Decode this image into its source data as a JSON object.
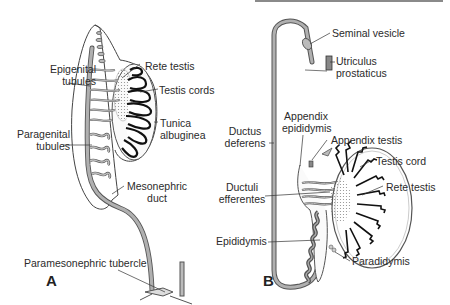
{
  "figure": {
    "panels": [
      {
        "id": "A",
        "label": "A",
        "labels": {
          "epigenital_tubules": [
            "Epigenital",
            "tubules"
          ],
          "paragenital_tubules": [
            "Paragenital",
            "tubules"
          ],
          "rete_testis": "Rete testis",
          "testis_cords": "Testis cords",
          "tunica_albuginea": [
            "Tunica",
            "albuginea"
          ],
          "mesonephric_duct": [
            "Mesonephric",
            "duct"
          ],
          "paramesonephric_tubercle": "Paramesonephric tubercle"
        }
      },
      {
        "id": "B",
        "label": "B",
        "labels": {
          "seminal_vesicle": "Seminal vesicle",
          "utriculus_prostaticus": [
            "Utriculus",
            "prostaticus"
          ],
          "appendix_epididymis": [
            "Appendix",
            "epididymis"
          ],
          "appendix_testis": "Appendix testis",
          "ductus_deferens": [
            "Ductus",
            "deferens"
          ],
          "testis_cord": "Testis cord",
          "ductuli_efferentes": [
            "Ductuli",
            "efferentes"
          ],
          "rete_testis": "Rete testis",
          "epididymis": "Epididymis",
          "paradidymis": "Paradidymis"
        }
      }
    ],
    "colors": {
      "duct": "#a9a9a9",
      "outline": "#3a3a3a",
      "cords": "#1a1a1a",
      "stipple": "#cfcfcf",
      "background": "#ffffff"
    }
  }
}
